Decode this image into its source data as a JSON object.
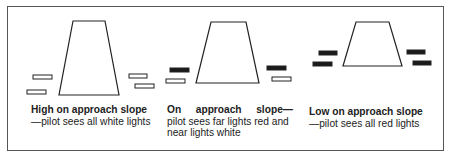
{
  "figure": {
    "panels": [
      {
        "id": "high",
        "title": "High on approach slope",
        "description": "—pilot sees all white lights",
        "runway": {
          "top_left": [
            73,
            21
          ],
          "top_right": [
            105,
            21
          ],
          "bottom_right": [
            119,
            95
          ],
          "bottom_left": [
            59,
            95
          ]
        },
        "lights": [
          {
            "side": "left",
            "position": "far",
            "color": "white",
            "x": 33,
            "y": 75,
            "w": 19,
            "h": 4
          },
          {
            "side": "left",
            "position": "near",
            "color": "white",
            "x": 27,
            "y": 90,
            "w": 19,
            "h": 4
          },
          {
            "side": "right",
            "position": "far",
            "color": "white",
            "x": 129,
            "y": 74,
            "w": 18,
            "h": 4
          },
          {
            "side": "right",
            "position": "near",
            "color": "white",
            "x": 135,
            "y": 84,
            "w": 19,
            "h": 4
          }
        ]
      },
      {
        "id": "on",
        "title": "On approach slope—",
        "description": "pilot sees far lights red and near lights white",
        "runway": {
          "top_left": [
            211,
            22
          ],
          "top_right": [
            246,
            22
          ],
          "bottom_right": [
            259,
            83
          ],
          "bottom_left": [
            196,
            83
          ]
        },
        "lights": [
          {
            "side": "left",
            "position": "far",
            "color": "red",
            "x": 170,
            "y": 68,
            "w": 19,
            "h": 4
          },
          {
            "side": "left",
            "position": "near",
            "color": "white",
            "x": 166,
            "y": 79,
            "w": 19,
            "h": 4
          },
          {
            "side": "right",
            "position": "far",
            "color": "red",
            "x": 267,
            "y": 66,
            "w": 19,
            "h": 4
          },
          {
            "side": "right",
            "position": "near",
            "color": "white",
            "x": 272,
            "y": 77,
            "w": 19,
            "h": 4
          }
        ]
      },
      {
        "id": "low",
        "title": "Low on approach slope",
        "description": "—pilot sees all red lights",
        "runway": {
          "top_left": [
            356,
            22
          ],
          "top_right": [
            389,
            22
          ],
          "bottom_right": [
            402,
            66
          ],
          "bottom_left": [
            343,
            66
          ]
        },
        "lights": [
          {
            "side": "left",
            "position": "far",
            "color": "red",
            "x": 319,
            "y": 51,
            "w": 18,
            "h": 4
          },
          {
            "side": "left",
            "position": "near",
            "color": "red",
            "x": 313,
            "y": 62,
            "w": 19,
            "h": 4
          },
          {
            "side": "right",
            "position": "far",
            "color": "red",
            "x": 407,
            "y": 50,
            "w": 18,
            "h": 4
          },
          {
            "side": "right",
            "position": "near",
            "color": "red",
            "x": 413,
            "y": 61,
            "w": 18,
            "h": 4
          }
        ]
      }
    ],
    "colors": {
      "stroke": "#222222",
      "red_light_fill": "#1a1a1a",
      "white_light_fill": "#ffffff"
    }
  }
}
